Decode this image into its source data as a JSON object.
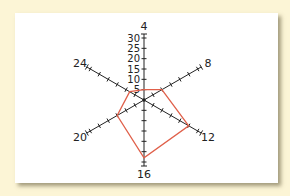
{
  "chart_data": {
    "type": "radar",
    "title": "",
    "axes": [
      "4",
      "8",
      "12",
      "16",
      "20",
      "24"
    ],
    "values": [
      5,
      10,
      25,
      28,
      15,
      8
    ],
    "radial_ticks": [
      5,
      10,
      15,
      20,
      25,
      30
    ],
    "radial_range": [
      0,
      30
    ],
    "grid": false,
    "legend": null,
    "series": [
      {
        "name": "",
        "color": "#e0604a",
        "values": [
          5,
          10,
          25,
          28,
          15,
          8
        ]
      }
    ]
  },
  "colors": {
    "background": "#fcf5d6",
    "card": "#ffffff",
    "axis": "#222222",
    "series": "#e0604a"
  }
}
